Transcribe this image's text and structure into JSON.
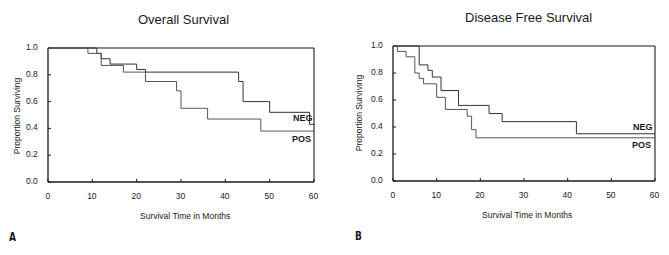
{
  "chart_data": [
    {
      "type": "line",
      "subtype": "kaplan-meier-step",
      "panel_label": "A",
      "title": "Overall Survival",
      "xlabel": "Survival Time in Months",
      "ylabel": "Proportion Surviving",
      "xlim": [
        0,
        60
      ],
      "ylim": [
        0,
        1.0
      ],
      "xticks": [
        "0",
        "10",
        "20",
        "30",
        "40",
        "50",
        "60"
      ],
      "yticks": [
        "0.0",
        "0.2",
        "0.4",
        "0.6",
        "0.8",
        "1.0"
      ],
      "grid": false,
      "series": [
        {
          "name": "NEG",
          "steps": [
            [
              0,
              1.0
            ],
            [
              11,
              0.96
            ],
            [
              12,
              0.92
            ],
            [
              14,
              0.88
            ],
            [
              20,
              0.84
            ],
            [
              22,
              0.82
            ],
            [
              43,
              0.75
            ],
            [
              44,
              0.6
            ],
            [
              50,
              0.52
            ],
            [
              59,
              0.43
            ],
            [
              60,
              0.43
            ]
          ]
        },
        {
          "name": "POS",
          "steps": [
            [
              0,
              1.0
            ],
            [
              9,
              0.96
            ],
            [
              12,
              0.87
            ],
            [
              17,
              0.82
            ],
            [
              22,
              0.75
            ],
            [
              29,
              0.68
            ],
            [
              30,
              0.55
            ],
            [
              36,
              0.47
            ],
            [
              48,
              0.38
            ],
            [
              60,
              0.38
            ]
          ]
        }
      ]
    },
    {
      "type": "line",
      "subtype": "kaplan-meier-step",
      "panel_label": "B",
      "title": "Disease Free Survival",
      "xlabel": "Survival Time in Months",
      "ylabel": "Proportion Surviving",
      "xlim": [
        0,
        60
      ],
      "ylim": [
        0,
        1.0
      ],
      "xticks": [
        "0",
        "10",
        "20",
        "30",
        "40",
        "50",
        "60"
      ],
      "yticks": [
        "0.0",
        "0.2",
        "0.4",
        "0.6",
        "0.8",
        "1.0"
      ],
      "grid": false,
      "series": [
        {
          "name": "NEG",
          "steps": [
            [
              0,
              1.0
            ],
            [
              6,
              0.86
            ],
            [
              8,
              0.82
            ],
            [
              9,
              0.77
            ],
            [
              11,
              0.67
            ],
            [
              15,
              0.56
            ],
            [
              22,
              0.5
            ],
            [
              25,
              0.44
            ],
            [
              42,
              0.35
            ],
            [
              60,
              0.35
            ]
          ]
        },
        {
          "name": "POS",
          "steps": [
            [
              0,
              1.0
            ],
            [
              1,
              0.96
            ],
            [
              3,
              0.92
            ],
            [
              5,
              0.8
            ],
            [
              6,
              0.76
            ],
            [
              7,
              0.72
            ],
            [
              10,
              0.62
            ],
            [
              12,
              0.53
            ],
            [
              17,
              0.48
            ],
            [
              18,
              0.38
            ],
            [
              19,
              0.32
            ],
            [
              60,
              0.32
            ]
          ]
        }
      ]
    }
  ],
  "panels": [
    {
      "label": "A",
      "title": "Overall Survival",
      "xlabel": "Survival Time in Months",
      "ylabel": "Proportion Surviving",
      "neg_label": "NEG",
      "pos_label": "POS"
    },
    {
      "label": "B",
      "title": "Disease Free Survival",
      "xlabel": "Survival Time in Months",
      "ylabel": "Proportion Surviving",
      "neg_label": "NEG",
      "pos_label": "POS"
    }
  ],
  "colors": {
    "axis": "#1a1a1a",
    "neg_line": "#333333",
    "pos_line": "#555555"
  }
}
